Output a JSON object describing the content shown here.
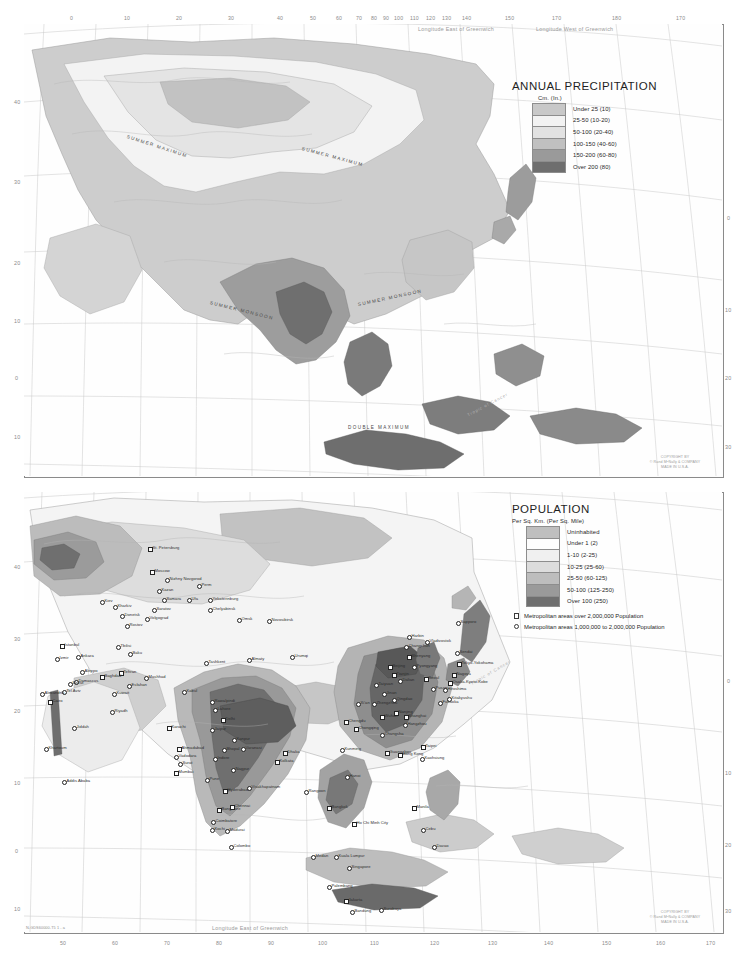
{
  "document": {
    "type": "atlas-plate",
    "region": "Asia",
    "plate_id": "N-GDS60000-T5  1 - a"
  },
  "precipitation_map": {
    "legend": {
      "title": "ANNUAL PRECIPITATION",
      "subtitle": "Cm. (In.)",
      "classes": [
        {
          "label": "Under 25 (10)",
          "color": "#c8c8c8"
        },
        {
          "label": "25-50 (10-20)",
          "color": "#f2f2f2"
        },
        {
          "label": "50-100 (20-40)",
          "color": "#e2e2e2"
        },
        {
          "label": "100-150 (40-60)",
          "color": "#c0c0c0"
        },
        {
          "label": "150-200 (60-80)",
          "color": "#9a9a9a"
        },
        {
          "label": "Over 200 (80)",
          "color": "#6e6e6e"
        }
      ]
    },
    "annotations": [
      "SUMMER MAXIMUM",
      "SUMMER MAXIMUM",
      "SUMMER MONSOON",
      "SUMMER MONSOON",
      "DOUBLE MAXIMUM"
    ],
    "margin": {
      "top_left_note": "Longitude East of Greenwich",
      "top_right_note": "Longitude West of Greenwich",
      "top_ticks": [
        "0",
        "10",
        "20",
        "30",
        "40",
        "50",
        "60",
        "70",
        "80",
        "90",
        "100",
        "110",
        "120",
        "130",
        "140",
        "150",
        "160",
        "170",
        "180",
        "170",
        "160"
      ],
      "left_ticks": [
        "40",
        "30",
        "20",
        "10",
        "0",
        "10"
      ],
      "right_ticks": [
        "0",
        "10",
        "20",
        "30"
      ],
      "tropic_label": "Tropic of Cancer"
    },
    "copyright": [
      "COPYRIGHT BY",
      "© Rand MᴺNally & COMPANY",
      "MADE IN U.S.A."
    ]
  },
  "population_map": {
    "legend": {
      "title": "POPULATION",
      "subtitle": "Per Sq. Km. (Per Sq. Mile)",
      "classes": [
        {
          "label": "Uninhabited",
          "color": "#bfbfbf"
        },
        {
          "label": "Under 1 (2)",
          "color": "#fdfdfd"
        },
        {
          "label": "1-10 (2-25)",
          "color": "#f0f0f0"
        },
        {
          "label": "10-25 (25-60)",
          "color": "#dcdcdc"
        },
        {
          "label": "25-50 (60-125)",
          "color": "#bdbdbd"
        },
        {
          "label": "50-100 (125-250)",
          "color": "#9a9a9a"
        },
        {
          "label": "Over 100 (250)",
          "color": "#6f6f6f"
        }
      ],
      "symbols": [
        {
          "shape": "square",
          "label": "Metropolitan areas over 2,000,000 Population"
        },
        {
          "shape": "circle",
          "label": "Metropolitan areas 1,000,000 to 2,000,000 Population"
        }
      ]
    },
    "margin": {
      "bottom_note": "Longitude East of Greenwich",
      "bottom_ticks": [
        "50",
        "60",
        "70",
        "80",
        "90",
        "100",
        "110",
        "120",
        "130",
        "140",
        "150",
        "160",
        "170"
      ],
      "left_ticks": [
        "40",
        "30",
        "20",
        "10",
        "0",
        "10"
      ],
      "right_ticks": [
        "0",
        "10",
        "20",
        "30"
      ],
      "tropic_label": "Tropic of Cancer"
    },
    "cities": [
      {
        "name": "St. Petersburg",
        "x": 148,
        "y": 547,
        "sym": "square"
      },
      {
        "name": "Moscow",
        "x": 150,
        "y": 570,
        "sym": "square"
      },
      {
        "name": "Nizhny Novgorod",
        "x": 165,
        "y": 578,
        "sym": "circle"
      },
      {
        "name": "Perm",
        "x": 197,
        "y": 584,
        "sym": "circle"
      },
      {
        "name": "Kazan",
        "x": 157,
        "y": 589,
        "sym": "circle"
      },
      {
        "name": "Samara",
        "x": 162,
        "y": 598,
        "sym": "circle"
      },
      {
        "name": "Ufa",
        "x": 187,
        "y": 598,
        "sym": "circle"
      },
      {
        "name": "Yekaterinburg",
        "x": 208,
        "y": 598,
        "sym": "circle"
      },
      {
        "name": "Chelyabinsk",
        "x": 208,
        "y": 608,
        "sym": "circle"
      },
      {
        "name": "Saratov",
        "x": 152,
        "y": 608,
        "sym": "circle"
      },
      {
        "name": "Omsk",
        "x": 237,
        "y": 618,
        "sym": "circle"
      },
      {
        "name": "Novosibirsk",
        "x": 267,
        "y": 619,
        "sym": "circle"
      },
      {
        "name": "Volgograd",
        "x": 145,
        "y": 617,
        "sym": "circle"
      },
      {
        "name": "Donetsk",
        "x": 120,
        "y": 614,
        "sym": "circle"
      },
      {
        "name": "Rostov",
        "x": 125,
        "y": 624,
        "sym": "circle"
      },
      {
        "name": "Kiev",
        "x": 100,
        "y": 600,
        "sym": "circle"
      },
      {
        "name": "Kharkiv",
        "x": 113,
        "y": 605,
        "sym": "circle"
      },
      {
        "name": "Baku",
        "x": 128,
        "y": 652,
        "sym": "circle"
      },
      {
        "name": "Tbilisi",
        "x": 116,
        "y": 645,
        "sym": "circle"
      },
      {
        "name": "Tashkent",
        "x": 204,
        "y": 661,
        "sym": "circle"
      },
      {
        "name": "Almaty",
        "x": 247,
        "y": 658,
        "sym": "circle"
      },
      {
        "name": "Urumqi",
        "x": 290,
        "y": 655,
        "sym": "circle"
      },
      {
        "name": "Tehran",
        "x": 119,
        "y": 671,
        "sym": "square"
      },
      {
        "name": "Esfahan",
        "x": 127,
        "y": 684,
        "sym": "circle"
      },
      {
        "name": "Mashhad",
        "x": 144,
        "y": 676,
        "sym": "circle"
      },
      {
        "name": "Baghdad",
        "x": 100,
        "y": 675,
        "sym": "square"
      },
      {
        "name": "Ankara",
        "x": 76,
        "y": 655,
        "sym": "circle"
      },
      {
        "name": "Istanbul",
        "x": 60,
        "y": 644,
        "sym": "square"
      },
      {
        "name": "Izmir",
        "x": 55,
        "y": 657,
        "sym": "circle"
      },
      {
        "name": "Damascus",
        "x": 74,
        "y": 680,
        "sym": "circle"
      },
      {
        "name": "Aleppo",
        "x": 80,
        "y": 670,
        "sym": "circle"
      },
      {
        "name": "Beirut",
        "x": 68,
        "y": 682,
        "sym": "circle"
      },
      {
        "name": "Tel Aviv",
        "x": 62,
        "y": 690,
        "sym": "circle"
      },
      {
        "name": "Cairo",
        "x": 48,
        "y": 700,
        "sym": "square"
      },
      {
        "name": "Alexandria",
        "x": 40,
        "y": 692,
        "sym": "circle"
      },
      {
        "name": "Riyadh",
        "x": 110,
        "y": 710,
        "sym": "circle"
      },
      {
        "name": "Jiddah",
        "x": 72,
        "y": 726,
        "sym": "circle"
      },
      {
        "name": "Kuwait",
        "x": 112,
        "y": 692,
        "sym": "circle"
      },
      {
        "name": "Khartoum",
        "x": 44,
        "y": 747,
        "sym": "circle"
      },
      {
        "name": "Addis Ababa",
        "x": 62,
        "y": 780,
        "sym": "circle"
      },
      {
        "name": "Karachi",
        "x": 167,
        "y": 726,
        "sym": "square"
      },
      {
        "name": "Kabul",
        "x": 182,
        "y": 690,
        "sym": "circle"
      },
      {
        "name": "Rawalpindi",
        "x": 210,
        "y": 700,
        "sym": "circle"
      },
      {
        "name": "Lahore",
        "x": 213,
        "y": 708,
        "sym": "circle"
      },
      {
        "name": "Delhi",
        "x": 221,
        "y": 718,
        "sym": "square"
      },
      {
        "name": "Jaipur",
        "x": 210,
        "y": 728,
        "sym": "circle"
      },
      {
        "name": "Kanpur",
        "x": 232,
        "y": 738,
        "sym": "circle"
      },
      {
        "name": "Varanasi",
        "x": 241,
        "y": 747,
        "sym": "circle"
      },
      {
        "name": "Ahmadabad",
        "x": 177,
        "y": 747,
        "sym": "square"
      },
      {
        "name": "Vadodara",
        "x": 174,
        "y": 755,
        "sym": "circle"
      },
      {
        "name": "Indore",
        "x": 213,
        "y": 757,
        "sym": "circle"
      },
      {
        "name": "Bhopal",
        "x": 222,
        "y": 748,
        "sym": "circle"
      },
      {
        "name": "Surat",
        "x": 178,
        "y": 762,
        "sym": "circle"
      },
      {
        "name": "Nagpur",
        "x": 231,
        "y": 768,
        "sym": "circle"
      },
      {
        "name": "Mumbai",
        "x": 174,
        "y": 771,
        "sym": "square"
      },
      {
        "name": "Pune",
        "x": 205,
        "y": 778,
        "sym": "circle"
      },
      {
        "name": "Hyderabad",
        "x": 223,
        "y": 789,
        "sym": "square"
      },
      {
        "name": "Visakhapatnam",
        "x": 247,
        "y": 786,
        "sym": "circle"
      },
      {
        "name": "Bangalore",
        "x": 217,
        "y": 808,
        "sym": "square"
      },
      {
        "name": "Chennai",
        "x": 230,
        "y": 805,
        "sym": "square"
      },
      {
        "name": "Coimbatore",
        "x": 211,
        "y": 820,
        "sym": "circle"
      },
      {
        "name": "Kochi",
        "x": 210,
        "y": 828,
        "sym": "circle"
      },
      {
        "name": "Madurai",
        "x": 225,
        "y": 829,
        "sym": "circle"
      },
      {
        "name": "Colombo",
        "x": 229,
        "y": 845,
        "sym": "circle"
      },
      {
        "name": "Kolkata",
        "x": 275,
        "y": 760,
        "sym": "square"
      },
      {
        "name": "Dhaka",
        "x": 283,
        "y": 751,
        "sym": "square"
      },
      {
        "name": "Rangoon",
        "x": 304,
        "y": 790,
        "sym": "circle"
      },
      {
        "name": "Bangkok",
        "x": 327,
        "y": 806,
        "sym": "square"
      },
      {
        "name": "Hanoi",
        "x": 345,
        "y": 775,
        "sym": "circle"
      },
      {
        "name": "Ho Chi Minh City",
        "x": 352,
        "y": 822,
        "sym": "square"
      },
      {
        "name": "Kuala Lumpur",
        "x": 334,
        "y": 855,
        "sym": "circle"
      },
      {
        "name": "Singapore",
        "x": 347,
        "y": 866,
        "sym": "circle"
      },
      {
        "name": "Medan",
        "x": 311,
        "y": 855,
        "sym": "circle"
      },
      {
        "name": "Palembang",
        "x": 327,
        "y": 885,
        "sym": "circle"
      },
      {
        "name": "Jakarta",
        "x": 344,
        "y": 899,
        "sym": "square"
      },
      {
        "name": "Bandung",
        "x": 350,
        "y": 910,
        "sym": "circle"
      },
      {
        "name": "Surabaya",
        "x": 379,
        "y": 908,
        "sym": "circle"
      },
      {
        "name": "Manila",
        "x": 412,
        "y": 806,
        "sym": "square"
      },
      {
        "name": "Cebu",
        "x": 421,
        "y": 828,
        "sym": "circle"
      },
      {
        "name": "Davao",
        "x": 432,
        "y": 845,
        "sym": "circle"
      },
      {
        "name": "Beijing",
        "x": 388,
        "y": 665,
        "sym": "square"
      },
      {
        "name": "Tianjin",
        "x": 392,
        "y": 673,
        "sym": "square"
      },
      {
        "name": "Shenyang",
        "x": 407,
        "y": 655,
        "sym": "square"
      },
      {
        "name": "Harbin",
        "x": 407,
        "y": 635,
        "sym": "circle"
      },
      {
        "name": "Changchun",
        "x": 404,
        "y": 645,
        "sym": "circle"
      },
      {
        "name": "Dalian",
        "x": 398,
        "y": 679,
        "sym": "circle"
      },
      {
        "name": "Qingdao",
        "x": 392,
        "y": 698,
        "sym": "circle"
      },
      {
        "name": "Jinan",
        "x": 382,
        "y": 692,
        "sym": "circle"
      },
      {
        "name": "Zhengzhou",
        "x": 372,
        "y": 702,
        "sym": "circle"
      },
      {
        "name": "Xi'an",
        "x": 356,
        "y": 702,
        "sym": "circle"
      },
      {
        "name": "Taiyuan",
        "x": 374,
        "y": 683,
        "sym": "circle"
      },
      {
        "name": "Wuhan",
        "x": 380,
        "y": 715,
        "sym": "square"
      },
      {
        "name": "Nanjing",
        "x": 394,
        "y": 711,
        "sym": "square"
      },
      {
        "name": "Shanghai",
        "x": 404,
        "y": 715,
        "sym": "square"
      },
      {
        "name": "Hangzhou",
        "x": 403,
        "y": 723,
        "sym": "circle"
      },
      {
        "name": "Chengdu",
        "x": 344,
        "y": 720,
        "sym": "square"
      },
      {
        "name": "Chongqing",
        "x": 354,
        "y": 727,
        "sym": "square"
      },
      {
        "name": "Changsha",
        "x": 380,
        "y": 733,
        "sym": "circle"
      },
      {
        "name": "Guangzhou",
        "x": 385,
        "y": 751,
        "sym": "square"
      },
      {
        "name": "Hong Kong",
        "x": 398,
        "y": 753,
        "sym": "square"
      },
      {
        "name": "Kunming",
        "x": 340,
        "y": 748,
        "sym": "circle"
      },
      {
        "name": "Taipei",
        "x": 421,
        "y": 745,
        "sym": "square"
      },
      {
        "name": "Kaohsiung",
        "x": 420,
        "y": 757,
        "sym": "circle"
      },
      {
        "name": "Pyongyang",
        "x": 412,
        "y": 665,
        "sym": "circle"
      },
      {
        "name": "Seoul",
        "x": 424,
        "y": 677,
        "sym": "square"
      },
      {
        "name": "Pusan",
        "x": 431,
        "y": 687,
        "sym": "circle"
      },
      {
        "name": "Fukuoka",
        "x": 438,
        "y": 701,
        "sym": "circle"
      },
      {
        "name": "Hiroshima",
        "x": 443,
        "y": 688,
        "sym": "circle"
      },
      {
        "name": "Osaka-Kyoto-Kobe",
        "x": 448,
        "y": 681,
        "sym": "square"
      },
      {
        "name": "Nagoya",
        "x": 452,
        "y": 673,
        "sym": "square"
      },
      {
        "name": "Tokyo-Yokohama",
        "x": 457,
        "y": 662,
        "sym": "square"
      },
      {
        "name": "Sendai",
        "x": 455,
        "y": 651,
        "sym": "circle"
      },
      {
        "name": "Sapporo",
        "x": 456,
        "y": 621,
        "sym": "circle"
      },
      {
        "name": "Kitakyushu",
        "x": 447,
        "y": 697,
        "sym": "circle"
      },
      {
        "name": "Vladivostok",
        "x": 425,
        "y": 640,
        "sym": "circle"
      }
    ],
    "copyright": [
      "COPYRIGHT BY",
      "© Rand MᴺNally & COMPANY",
      "MADE IN U.S.A."
    ]
  }
}
